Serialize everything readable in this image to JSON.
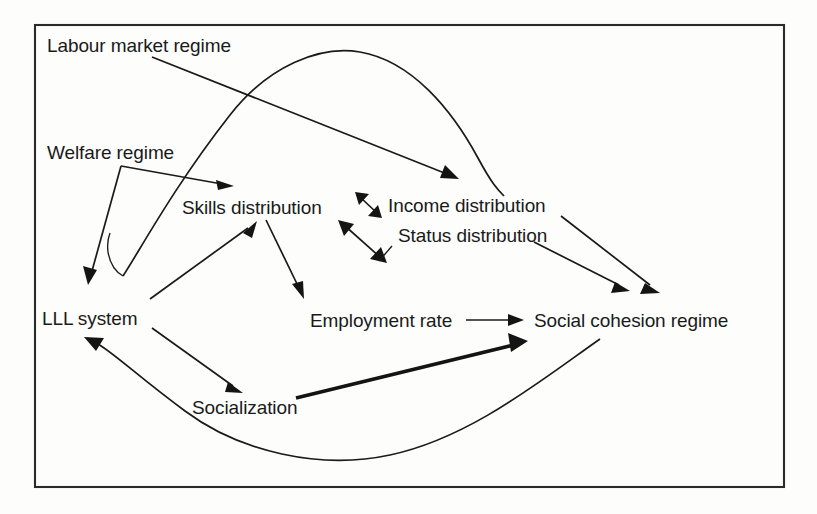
{
  "figure": {
    "type": "causal-loop-diagram",
    "frame": {
      "x": 34,
      "y": 24,
      "width": 750,
      "height": 463
    }
  },
  "nodes": [
    {
      "id": "labour-market-regime",
      "label": "Labour market regime",
      "x": 47,
      "y": 36
    },
    {
      "id": "welfare-regime",
      "label": "Welfare regime",
      "x": 47,
      "y": 143
    },
    {
      "id": "skills-distribution",
      "label": "Skills distribution",
      "x": 182,
      "y": 198
    },
    {
      "id": "income-distribution",
      "label": "Income distribution",
      "x": 388,
      "y": 196
    },
    {
      "id": "status-distribution",
      "label": "Status distribution",
      "x": 398,
      "y": 226
    },
    {
      "id": "lll-system",
      "label": "LLL system",
      "x": 42,
      "y": 309
    },
    {
      "id": "employment-rate",
      "label": "Employment rate",
      "x": 310,
      "y": 311
    },
    {
      "id": "social-cohesion-regime",
      "label": "Social cohesion regime",
      "x": 534,
      "y": 311
    },
    {
      "id": "socialization",
      "label": "Socialization",
      "x": 192,
      "y": 398
    }
  ],
  "edges": [
    {
      "id": "e1",
      "from": "labour-market-regime",
      "to": "income-distribution-top",
      "style": "thin",
      "arrow": "single"
    },
    {
      "id": "e2",
      "from": "welfare-regime",
      "to": "skills-distribution",
      "style": "thin",
      "arrow": "single"
    },
    {
      "id": "e3",
      "from": "welfare-regime",
      "to": "lll-system",
      "style": "thin",
      "arrow": "single"
    },
    {
      "id": "e4",
      "from": "lll-system",
      "to": "labour-market-curve-peak",
      "style": "curve",
      "arrow": "none"
    },
    {
      "id": "e5",
      "from": "lll-system",
      "to": "skills-distribution",
      "style": "thin",
      "arrow": "single"
    },
    {
      "id": "e6",
      "from": "lll-system",
      "to": "socialization",
      "style": "thin",
      "arrow": "single"
    },
    {
      "id": "e7",
      "from": "skills-distribution",
      "to": "employment-rate",
      "style": "thin",
      "arrow": "single"
    },
    {
      "id": "e8",
      "from": "skills-distribution",
      "to": "income-distribution",
      "style": "thin",
      "arrow": "double"
    },
    {
      "id": "e9",
      "from": "skills-distribution",
      "to": "status-distribution",
      "style": "thin",
      "arrow": "double"
    },
    {
      "id": "e10",
      "from": "employment-rate",
      "to": "social-cohesion-regime",
      "style": "thin",
      "arrow": "single"
    },
    {
      "id": "e11",
      "from": "income-distribution",
      "to": "social-cohesion-regime",
      "style": "thin",
      "arrow": "single"
    },
    {
      "id": "e12",
      "from": "status-distribution",
      "to": "social-cohesion-regime",
      "style": "thin",
      "arrow": "single"
    },
    {
      "id": "e13",
      "from": "socialization",
      "to": "social-cohesion-regime",
      "style": "thick",
      "arrow": "single"
    },
    {
      "id": "e14",
      "from": "social-cohesion-regime",
      "to": "lll-system",
      "style": "curve",
      "arrow": "single"
    }
  ],
  "colors": {
    "background": "#fdfdfc",
    "frame_stroke": "#2b2b2b",
    "edge_stroke": "#1a1a1a",
    "label_text": "#1a1a1a"
  }
}
